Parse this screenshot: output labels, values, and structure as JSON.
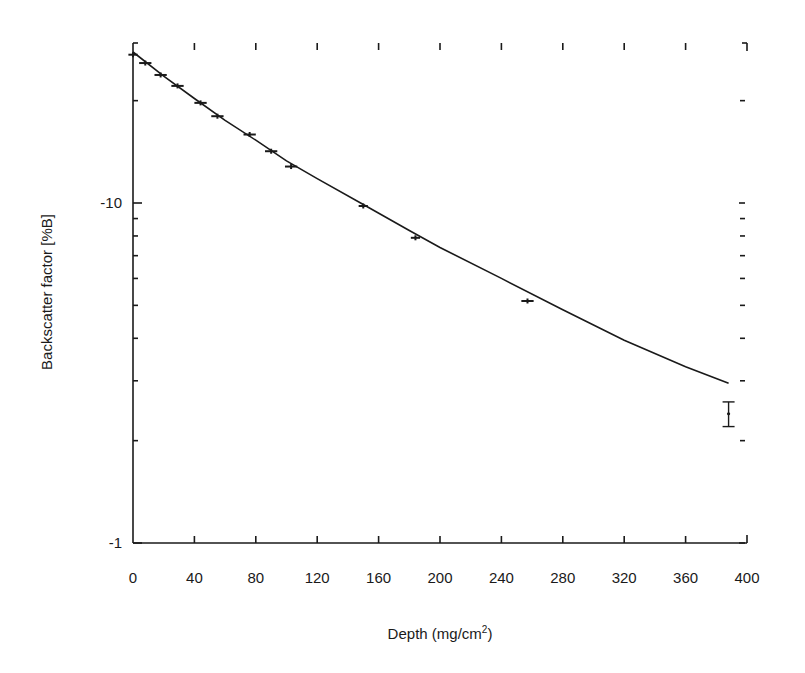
{
  "chart_data": {
    "type": "scatter",
    "title": "",
    "xlabel": "Depth (mg/cm",
    "xlabel_sup": "2",
    "xlabel_close": ")",
    "ylabel": "Backscatter factor [%B]",
    "xlim": [
      0,
      400
    ],
    "ylim_magnitude": [
      1,
      30
    ],
    "yscale": "log",
    "y_sign": "negative",
    "x_ticks": [
      0,
      40,
      80,
      120,
      160,
      200,
      240,
      280,
      320,
      360,
      400
    ],
    "x_tick_labels": [
      "0",
      "40",
      "80",
      "120",
      "160",
      "200",
      "240",
      "280",
      "320",
      "360",
      "400"
    ],
    "y_tick_labels": [
      {
        "value": -10,
        "label": "-10"
      },
      {
        "value": -1,
        "label": "-1"
      }
    ],
    "y_minor_ticks_magnitude": [
      2,
      3,
      4,
      5,
      6,
      7,
      8,
      9,
      20
    ],
    "grid": false,
    "legend": null,
    "series": [
      {
        "name": "Measured",
        "style": "points-with-xerror",
        "x": [
          0,
          8,
          18,
          29,
          44,
          55,
          76,
          90,
          103,
          150,
          184,
          257,
          388
        ],
        "y": [
          -27.3,
          -25.8,
          -23.8,
          -22.1,
          -19.7,
          -18.0,
          -15.9,
          -14.2,
          -12.8,
          -9.8,
          -7.9,
          -5.15,
          -2.4
        ],
        "x_err": [
          3,
          4,
          4,
          4,
          4,
          4,
          4,
          4,
          4,
          3,
          3,
          4,
          0
        ],
        "y_err_last": [
          -2.2,
          -2.6
        ]
      },
      {
        "name": "Fit",
        "style": "line",
        "x": [
          0,
          20,
          40,
          60,
          80,
          100,
          120,
          150,
          180,
          200,
          240,
          280,
          320,
          360,
          388
        ],
        "y": [
          -27.8,
          -23.6,
          -20.3,
          -17.5,
          -15.3,
          -13.3,
          -11.8,
          -9.9,
          -8.3,
          -7.4,
          -6.0,
          -4.85,
          -3.95,
          -3.3,
          -2.95
        ]
      }
    ]
  }
}
